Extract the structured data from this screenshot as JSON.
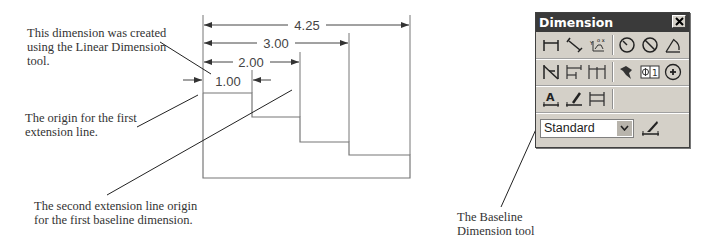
{
  "callouts": {
    "linear_dimension": [
      "This dimension was created",
      "using the Linear Dimension",
      "tool."
    ],
    "first_origin": [
      "The origin for the first",
      "extension line."
    ],
    "second_origin": [
      "The second extension line origin",
      "for the first baseline dimension."
    ],
    "baseline_tool": [
      "The Baseline",
      "Dimension tool"
    ]
  },
  "drawing": {
    "dimensions": [
      {
        "label": "4.25"
      },
      {
        "label": "3.00"
      },
      {
        "label": "2.00"
      },
      {
        "label": "1.00"
      }
    ]
  },
  "toolbar": {
    "title": "Dimension",
    "close_icon": "close-icon",
    "rows": [
      [
        "linear-dimension-icon",
        "aligned-dimension-icon",
        "ordinate-dimension-icon",
        "radius-dimension-icon",
        "diameter-dimension-icon",
        "angular-dimension-icon"
      ],
      [
        "quick-dimension-icon",
        "baseline-dimension-icon",
        "continue-dimension-icon",
        "quick-leader-icon",
        "tolerance-icon",
        "center-mark-icon"
      ],
      [
        "dimension-edit-icon",
        "dimension-text-edit-icon",
        "dimension-update-icon"
      ]
    ],
    "style_select": {
      "value": "Standard"
    },
    "style_icon": "dimension-style-icon"
  }
}
